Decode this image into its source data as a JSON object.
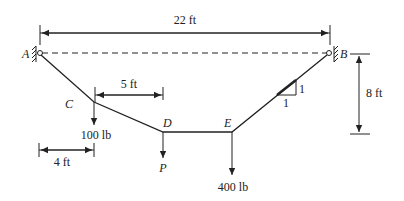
{
  "diagram": {
    "type": "cable-structure",
    "supports": [
      {
        "id": "A",
        "label": "A"
      },
      {
        "id": "B",
        "label": "B"
      }
    ],
    "nodes": [
      {
        "id": "C",
        "label": "C"
      },
      {
        "id": "D",
        "label": "D"
      },
      {
        "id": "E",
        "label": "E"
      }
    ],
    "loads": [
      {
        "at": "C",
        "label": "100 lb"
      },
      {
        "at": "D",
        "label": "P"
      },
      {
        "at": "E",
        "label": "400 lb"
      }
    ],
    "dimensions": {
      "span": "22 ft",
      "cd_horizontal": "5 ft",
      "ac_horizontal": "4 ft",
      "sag_vertical": "8 ft"
    },
    "slope": {
      "rise": "1",
      "run": "1"
    }
  }
}
